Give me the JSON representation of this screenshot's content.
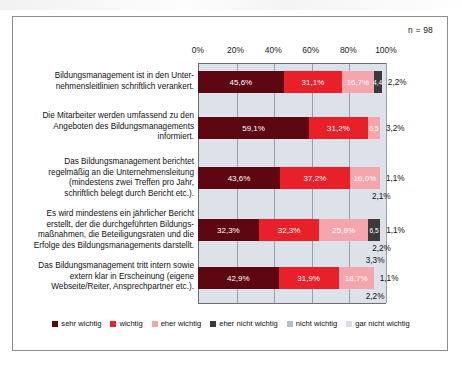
{
  "meta": {
    "n_label": "n = 98"
  },
  "chart_data": {
    "type": "bar",
    "orientation": "horizontal",
    "stacked": true,
    "stacked_mode": "percent",
    "title": "",
    "subtitle": "",
    "xlabel": "",
    "ylabel": "",
    "xlim": [
      0,
      100
    ],
    "xticks": [
      0,
      20,
      40,
      60,
      80,
      100
    ],
    "xtick_labels": [
      "0%",
      "20%",
      "40%",
      "60%",
      "80%",
      "100%"
    ],
    "grid": true,
    "legend_position": "bottom",
    "annotation": "n = 98",
    "categories": [
      "Bildungsmanagement ist in den Unter-\nnehmensleitlinien schriftlich verankert.",
      "Die Mitarbeiter werden umfassend zu den\nAngeboten des Bildungsmanagements\ninformiert.",
      "Das Bildungsmanagement berichtet\nregelmäßig an die Unternehmensleitung\n(mindestens zwei Treffen pro Jahr,\nschriftlich belegt durch Bericht etc.).",
      "Es wird mindestens ein jährlicher Bericht\nerstellt, der die durchgeführten Bildungs-\nmaßnahmen, die Beteiligungsraten und die\nErfolge des Bildungsmanagements darstellt.",
      "Das Bildungsmanagement tritt intern sowie\nextern klar in Erscheinung (eigene\nWebseite/Reiter, Ansprechpartner etc.)."
    ],
    "series": [
      {
        "name": "sehr wichtig",
        "color": "#5c0711",
        "values": [
          45.6,
          59.1,
          43.6,
          32.3,
          42.9
        ]
      },
      {
        "name": "wichtig",
        "color": "#e8202a",
        "values": [
          31.1,
          31.2,
          37.2,
          32.3,
          31.9
        ]
      },
      {
        "name": "eher wichtig",
        "color": "#f5a5ae",
        "values": [
          16.7,
          6.5,
          16.0,
          25.8,
          18.7
        ]
      },
      {
        "name": "eher nicht wichtig",
        "color": "#3a3a3c",
        "values": [
          4.4,
          3.2,
          1.1,
          6.5,
          1.1
        ]
      },
      {
        "name": "nicht wichtig",
        "color": "#b8bec9",
        "values": [
          2.2,
          0.0,
          2.1,
          1.1,
          2.2
        ]
      },
      {
        "name": "gar nicht wichtig",
        "color": "#dcdee3",
        "values": [
          0.0,
          0.0,
          0.0,
          2.2,
          3.3
        ]
      }
    ],
    "rows": [
      {
        "category": "Bildungsmanagement ist in den Unter-\nnehmensleitlinien schriftlich verankert.",
        "segments": [
          {
            "series": "sehr wichtig",
            "value": 45.6,
            "label": "45,6%",
            "label_placement": "inside"
          },
          {
            "series": "wichtig",
            "value": 31.1,
            "label": "31,1%",
            "label_placement": "inside"
          },
          {
            "series": "eher wichtig",
            "value": 16.7,
            "label": "16,7%",
            "label_placement": "inside"
          },
          {
            "series": "eher nicht wichtig",
            "value": 4.4,
            "label": "4,4",
            "label_placement": "inside"
          },
          {
            "series": "nicht wichtig",
            "value": 2.2,
            "label": "2,2%",
            "label_placement": "right"
          }
        ]
      },
      {
        "category": "Die Mitarbeiter werden umfassend zu den\nAngeboten des Bildungsmanagements\ninformiert.",
        "segments": [
          {
            "series": "sehr wichtig",
            "value": 59.1,
            "label": "59,1%",
            "label_placement": "inside"
          },
          {
            "series": "wichtig",
            "value": 31.2,
            "label": "31,2%",
            "label_placement": "inside"
          },
          {
            "series": "eher wichtig",
            "value": 6.5,
            "label": "6,5",
            "label_placement": "inside"
          },
          {
            "series": "eher nicht wichtig",
            "value": 3.2,
            "label": "3,2%",
            "label_placement": "right"
          }
        ]
      },
      {
        "category": "Das Bildungsmanagement berichtet\nregelmäßig an die Unternehmensleitung\n(mindestens zwei Treffen pro Jahr,\nschriftlich belegt durch Bericht etc.).",
        "segments": [
          {
            "series": "sehr wichtig",
            "value": 43.6,
            "label": "43,6%",
            "label_placement": "inside"
          },
          {
            "series": "wichtig",
            "value": 37.2,
            "label": "37,2%",
            "label_placement": "inside"
          },
          {
            "series": "eher wichtig",
            "value": 16.0,
            "label": "16,0%",
            "label_placement": "inside"
          },
          {
            "series": "eher nicht wichtig",
            "value": 1.1,
            "label": "1,1%",
            "label_placement": "right"
          },
          {
            "series": "nicht wichtig",
            "value": 2.1,
            "label": "2,1%",
            "label_placement": "below"
          }
        ]
      },
      {
        "category": "Es wird mindestens ein jährlicher Bericht\nerstellt, der die durchgeführten Bildungs-\nmaßnahmen, die Beteiligungsraten und die\nErfolge des Bildungsmanagements darstellt.",
        "segments": [
          {
            "series": "sehr wichtig",
            "value": 32.3,
            "label": "32,3%",
            "label_placement": "inside"
          },
          {
            "series": "wichtig",
            "value": 32.3,
            "label": "32,3%",
            "label_placement": "inside"
          },
          {
            "series": "eher wichtig",
            "value": 25.8,
            "label": "25,8%",
            "label_placement": "inside"
          },
          {
            "series": "eher nicht wichtig",
            "value": 6.5,
            "label": "6,5",
            "label_placement": "inside"
          },
          {
            "series": "nicht wichtig",
            "value": 1.1,
            "label": "1,1%",
            "label_placement": "right"
          },
          {
            "series": "gar nicht wichtig",
            "value": 2.2,
            "label": "2,2%",
            "label_placement": "below"
          }
        ]
      },
      {
        "category": "Das Bildungsmanagement tritt intern sowie\nextern klar in Erscheinung (eigene\nWebseite/Reiter, Ansprechpartner etc.).",
        "segments": [
          {
            "series": "gar nicht wichtig",
            "value": 3.3,
            "label": "3,3%",
            "label_placement": "above"
          },
          {
            "series": "sehr wichtig",
            "value": 42.9,
            "label": "42,9%",
            "label_placement": "inside"
          },
          {
            "series": "wichtig",
            "value": 31.9,
            "label": "31,9%",
            "label_placement": "inside"
          },
          {
            "series": "eher wichtig",
            "value": 18.7,
            "label": "18,7%",
            "label_placement": "inside"
          },
          {
            "series": "eher nicht wichtig",
            "value": 1.1,
            "label": "1,1%",
            "label_placement": "right"
          },
          {
            "series": "nicht wichtig",
            "value": 2.2,
            "label": "2,2%",
            "label_placement": "below"
          }
        ]
      }
    ],
    "legend": [
      {
        "label": "sehr wichtig",
        "color": "#5c0711"
      },
      {
        "label": "wichtig",
        "color": "#e8202a"
      },
      {
        "label": "eher wichtig",
        "color": "#f5a5ae"
      },
      {
        "label": "eher nicht wichtig",
        "color": "#3a3a3c"
      },
      {
        "label": "nicht wichtig",
        "color": "#b8bec9"
      },
      {
        "label": "gar nicht wichtig",
        "color": "#dcdee3"
      }
    ]
  }
}
